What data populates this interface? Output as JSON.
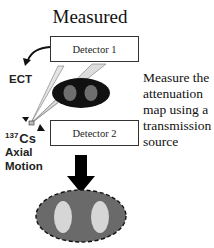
{
  "title": "Measured",
  "detectors": [
    {
      "label": "Detector 1"
    },
    {
      "label": "Detector 2"
    }
  ],
  "labels": {
    "ect": "ECT",
    "isotope_mass": "137",
    "isotope_symbol": "Cs",
    "axial_line1": "Axial",
    "axial_line2": "Motion"
  },
  "description": {
    "line1": "Measure the",
    "line2": "attenuation",
    "line3": "map using a",
    "line4": "transmission",
    "line5": "source"
  },
  "colors": {
    "phantom_dark": "#111111",
    "phantom_inner": "#6e6e6e",
    "map_body": "#6a6a6a",
    "map_inner": "#d6d6d6",
    "beam": "#d9d9d9"
  }
}
